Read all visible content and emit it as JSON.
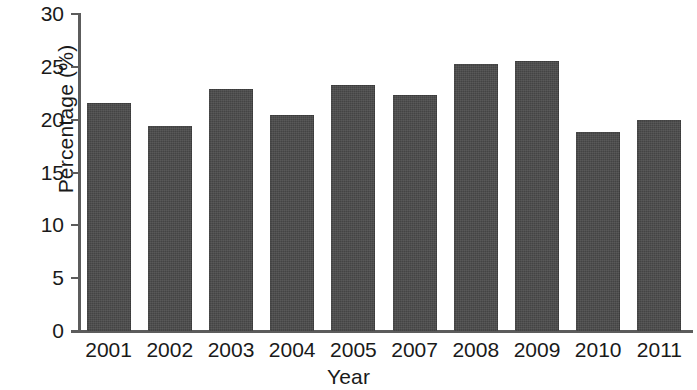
{
  "chart_data": {
    "type": "bar",
    "title": "",
    "subtitle": "",
    "xlabel": "Year",
    "ylabel": "Percentage (%)",
    "categories": [
      "2001",
      "2002",
      "2003",
      "2004",
      "2005",
      "2007",
      "2008",
      "2009",
      "2010",
      "2011"
    ],
    "values": [
      21.6,
      19.4,
      22.9,
      20.4,
      23.3,
      22.3,
      25.3,
      25.6,
      18.8,
      20.0
    ],
    "series": [
      {
        "name": "Percentage",
        "values": [
          21.6,
          19.4,
          22.9,
          20.4,
          23.3,
          22.3,
          25.3,
          25.6,
          18.8,
          20.0
        ]
      }
    ],
    "ylim": [
      0,
      30
    ],
    "y_ticks": [
      0,
      5,
      10,
      15,
      20,
      25,
      30
    ],
    "y_tick_labels": [
      "0",
      "5",
      "10",
      "15",
      "20",
      "25",
      "30"
    ],
    "x_tick_labels": [
      "2001",
      "2002",
      "2003",
      "2004",
      "2005",
      "2007",
      "2008",
      "2009",
      "2010",
      "2011"
    ],
    "grid": false,
    "legend": null,
    "legend_position": "none",
    "bar_color": "#4b4b4b",
    "axis_color": "#5c5c5c",
    "text_color": "#1a1a1a",
    "background_color": "#ffffff",
    "annotations": []
  }
}
